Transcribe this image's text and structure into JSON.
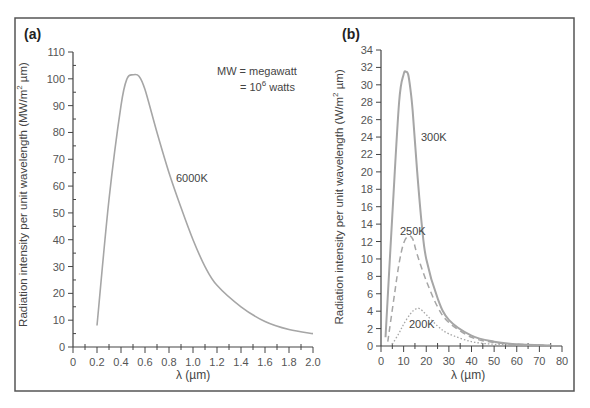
{
  "figure": {
    "panel_a": {
      "label": "(a)",
      "ylabel_main": "Radiation intensity per unit wavelength (MW/m",
      "ylabel_sup": "2",
      "ylabel_end": " µm)",
      "xlabel": "λ (µm)",
      "note_line1": "MW = megawatt",
      "note_line2_pre": "= 10",
      "note_line2_sup": "6",
      "note_line2_post": " watts",
      "curve_label": "6000K"
    },
    "panel_b": {
      "label": "(b)",
      "ylabel_main": "Radiation intensity per unit wavelength (W/m",
      "ylabel_sup": "2",
      "ylabel_end": " µm)",
      "xlabel": "λ (µm)",
      "curve_labels": [
        "300K",
        "250K",
        "200K"
      ]
    }
  },
  "chart_data": [
    {
      "type": "line",
      "title": "(a)",
      "xlabel": "λ (µm)",
      "ylabel": "Radiation intensity per unit wavelength (MW/m² µm)",
      "xlim": [
        0,
        2.0
      ],
      "ylim": [
        0,
        110
      ],
      "xticks": [
        0,
        0.2,
        0.4,
        0.6,
        0.8,
        1.0,
        1.2,
        1.4,
        1.6,
        1.8,
        2.0
      ],
      "xtick_labels": [
        "0",
        "0.2",
        "0.4",
        "0.6",
        "0.8",
        "1.0",
        "1.2",
        "1.4",
        "1.6",
        "1.8",
        "2.0"
      ],
      "yticks": [
        0,
        10,
        20,
        30,
        40,
        50,
        60,
        70,
        80,
        90,
        100,
        110
      ],
      "grid": false,
      "annotations": [
        "MW = megawatt",
        "= 10^6 watts",
        "6000K"
      ],
      "series": [
        {
          "name": "6000K",
          "style": "solid",
          "x": [
            0.2,
            0.3,
            0.4,
            0.45,
            0.5,
            0.55,
            0.6,
            0.7,
            0.8,
            0.9,
            1.0,
            1.1,
            1.2,
            1.4,
            1.6,
            1.8,
            2.0
          ],
          "y": [
            8,
            55,
            90,
            100,
            101.5,
            101,
            96,
            80,
            65,
            52,
            40,
            30,
            23,
            15,
            9.5,
            6.5,
            5
          ]
        }
      ]
    },
    {
      "type": "line",
      "title": "(b)",
      "xlabel": "λ (µm)",
      "ylabel": "Radiation intensity per unit wavelength (W/m² µm)",
      "xlim": [
        0,
        80
      ],
      "ylim": [
        0,
        34
      ],
      "xticks": [
        0,
        10,
        20,
        30,
        40,
        50,
        60,
        70,
        80
      ],
      "xtick_labels": [
        "0",
        "10",
        "20",
        "30",
        "40",
        "50",
        "60",
        "70",
        "80"
      ],
      "yticks": [
        0,
        2,
        4,
        6,
        8,
        10,
        12,
        14,
        16,
        18,
        20,
        22,
        24,
        26,
        28,
        30,
        32,
        34
      ],
      "grid": false,
      "series": [
        {
          "name": "300K",
          "style": "solid",
          "x": [
            2,
            5,
            8,
            10,
            11,
            12,
            13,
            14,
            16,
            18,
            20,
            25,
            30,
            40,
            50,
            60,
            75
          ],
          "y": [
            1,
            15,
            28,
            31.2,
            31.5,
            31.2,
            29.5,
            27,
            20,
            14,
            10,
            5.5,
            3,
            1.2,
            0.5,
            0.2,
            0.05
          ]
        },
        {
          "name": "250K",
          "style": "dashed",
          "x": [
            3,
            6,
            8,
            10,
            12,
            14,
            16,
            20,
            25,
            30,
            40,
            50,
            60,
            75
          ],
          "y": [
            0.5,
            6,
            9.5,
            11.8,
            12.6,
            12.3,
            10.5,
            7.5,
            4.5,
            2.7,
            1,
            0.4,
            0.2,
            0.05
          ]
        },
        {
          "name": "200K",
          "style": "dotted",
          "x": [
            5,
            8,
            10,
            13,
            15,
            17,
            20,
            25,
            30,
            40,
            50,
            60,
            75
          ],
          "y": [
            0.2,
            1.5,
            2.5,
            3.7,
            4.2,
            4.3,
            3.6,
            2.3,
            1.4,
            0.5,
            0.2,
            0.1,
            0.02
          ]
        }
      ]
    }
  ]
}
